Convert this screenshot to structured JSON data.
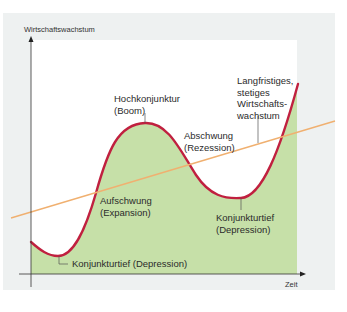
{
  "diagram": {
    "type": "economic-cycle",
    "y_axis_label": "Wirtschaftswachstum",
    "x_axis_label": "Zeit",
    "labels": {
      "boom": {
        "line1": "Hochkonjunktur",
        "line2": "(Boom)"
      },
      "recession": {
        "line1": "Abschwung",
        "line2": "(Rezession)"
      },
      "trend": {
        "line1": "Langfristiges,",
        "line2": "stetiges",
        "line3": "Wirtschafts-",
        "line4": "wachstum"
      },
      "expansion": {
        "line1": "Aufschwung",
        "line2": "(Expansion)"
      },
      "depression_right": {
        "line1": "Konjunkturtief",
        "line2": "(Depression)"
      },
      "depression_left": "Konjunkturtief (Depression)"
    },
    "colors": {
      "panel_bg": "#eef1f1",
      "plot_bg": "#ffffff",
      "fill": "#c6e0a8",
      "curve": "#c0203f",
      "trend_line": "#f0b070",
      "axis": "#333333"
    }
  }
}
